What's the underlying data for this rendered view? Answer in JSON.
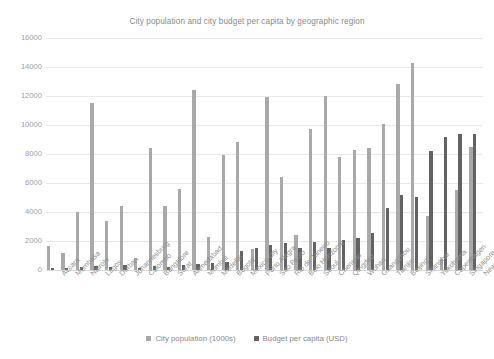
{
  "chart_data": {
    "type": "bar",
    "title": "City population and city budget per capita by geographic region",
    "xlabel": "",
    "ylabel": "",
    "ylim": [
      0,
      16000
    ],
    "yticks": [
      0,
      2000,
      4000,
      6000,
      8000,
      10000,
      12000,
      14000,
      16000
    ],
    "grid": true,
    "legend_position": "bottom",
    "categories": [
      "Accara",
      "Mombasa",
      "Nairobi",
      "Lagos",
      "Durban",
      "Johannesburg",
      "Colombo",
      "Bangalore",
      "Surat",
      "Ahmedabad",
      "Mumbai",
      "Medellin",
      "Bogota",
      "Mexico city",
      "Porto Alegra",
      "Sao Paulo",
      "Rio de Janeiro",
      "Belo Horizonte",
      "Seoul",
      "Chengdu",
      "Qingdao",
      "Wuhan",
      "Guangzhou",
      "Tianjin",
      "Beijing",
      "Shanghai",
      "Yokohama",
      "Copenhagen",
      "Singapore",
      "New York"
    ],
    "series": [
      {
        "name": "City population (1000s)",
        "color": "#a9a9a9",
        "values": [
          1670,
          1200,
          4000,
          11500,
          3400,
          4400,
          800,
          8400,
          4400,
          5600,
          12400,
          2300,
          7900,
          8800,
          1450,
          11900,
          6400,
          2400,
          9700,
          12000,
          7800,
          8300,
          8400,
          10100,
          12800,
          14300,
          3700,
          790,
          5500,
          8500
        ]
      },
      {
        "name": "Budget per capita (USD)",
        "color": "#636363",
        "values": [
          120,
          150,
          230,
          300,
          180,
          320,
          170,
          290,
          200,
          330,
          390,
          500,
          560,
          1300,
          1500,
          1700,
          1850,
          1550,
          1900,
          1500,
          2050,
          2200,
          2550,
          4300,
          5150,
          5050,
          8200,
          9200,
          9400,
          9400
        ]
      }
    ]
  },
  "legend": {
    "items": [
      {
        "label": "City population (1000s)",
        "color": "#a9a9a9"
      },
      {
        "label": "Budget per capita (USD)",
        "color": "#636363"
      }
    ]
  }
}
